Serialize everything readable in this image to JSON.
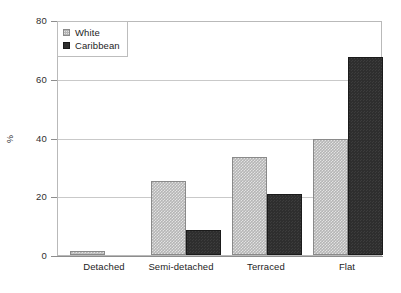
{
  "chart_data": {
    "type": "bar",
    "title": "",
    "subtitle": "",
    "xlabel": "",
    "ylabel": "%",
    "ylim": [
      0,
      80
    ],
    "yticks": [
      0,
      20,
      40,
      60,
      80
    ],
    "ytick_labels": [
      "0",
      "20",
      "40",
      "60",
      "80"
    ],
    "grid": true,
    "grid_axis": "y",
    "legend_position": "top-left",
    "categories": [
      "Detached",
      "Semi-detached",
      "Terraced",
      "Flat"
    ],
    "series": [
      {
        "name": "White",
        "color": "#b5b5b5",
        "fill": "light-gray-checkered",
        "values": [
          1.5,
          25.5,
          33.5,
          40
        ]
      },
      {
        "name": "Caribbean",
        "color": "#2e2e2e",
        "fill": "dark-solid",
        "values": [
          0,
          8.5,
          21,
          68
        ]
      }
    ]
  },
  "legend": {
    "items": [
      {
        "label": "White",
        "swatch": "legend-swatch-light-gray"
      },
      {
        "label": "Caribbean",
        "swatch": "legend-swatch-dark"
      }
    ]
  },
  "axes": {
    "y_title": "%",
    "y_tick_labels": [
      "80",
      "60",
      "40",
      "20",
      "0"
    ],
    "x_tick_labels": [
      "Detached",
      "Semi-detached",
      "Terraced",
      "Flat"
    ]
  }
}
